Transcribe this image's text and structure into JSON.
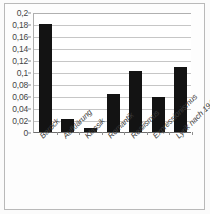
{
  "chart_data": {
    "type": "bar",
    "title": "",
    "xlabel": "",
    "ylabel": "",
    "categories": [
      "Barock",
      "Aufklärung",
      "Klassik",
      "Romantik",
      "Realismus",
      "Expressionismus",
      "Lyrik nach 1945"
    ],
    "values": [
      0.18,
      0.021,
      0.006,
      0.063,
      0.101,
      0.059,
      0.109
    ],
    "ylim": [
      0,
      0.2
    ],
    "ytick_values": [
      0,
      0.02,
      0.04,
      0.06,
      0.08,
      0.1,
      0.12,
      0.14,
      0.16,
      0.18,
      0.2
    ],
    "ytick_labels": [
      "0",
      "0,02",
      "0,04",
      "0,06",
      "0,08",
      "0,1",
      "0,12",
      "0,14",
      "0,16",
      "0,18",
      "0,2"
    ],
    "grid": true,
    "grid_axis": "y",
    "legend": false,
    "legend_position": "none",
    "series": [
      {
        "name": "Anteil",
        "values": [
          0.18,
          0.021,
          0.006,
          0.063,
          0.101,
          0.059,
          0.109
        ]
      }
    ],
    "bar_color": "#131313",
    "plot_background": "#ffffff",
    "gridline_color": "#c6c6c6",
    "axis_color": "#6e6e6e"
  }
}
